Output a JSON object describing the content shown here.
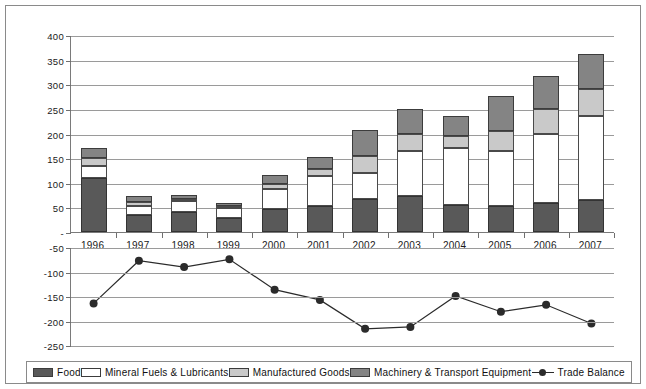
{
  "chart_data": {
    "type": "bar",
    "title": "",
    "xlabel": "",
    "ylabel": "",
    "grid": true,
    "legend_position": "bottom",
    "categories": [
      "1996",
      "1997",
      "1998",
      "1999",
      "2000",
      "2001",
      "2002",
      "2003",
      "2004",
      "2005",
      "2006",
      "2007"
    ],
    "upper_panel": {
      "ylim": [
        0,
        400
      ],
      "yticks": [
        0,
        50,
        100,
        150,
        200,
        250,
        300,
        350,
        400
      ],
      "ytick_labels": [
        "-",
        "50",
        "100",
        "150",
        "200",
        "250",
        "300",
        "350",
        "400"
      ],
      "stacked": true,
      "series": [
        {
          "name": "Food",
          "values": [
            110,
            35,
            40,
            28,
            47,
            52,
            68,
            73,
            55,
            52,
            58,
            65
          ]
        },
        {
          "name": "Mineral Fuels & Lubricants",
          "values": [
            24,
            18,
            22,
            20,
            41,
            61,
            52,
            92,
            115,
            113,
            142,
            170
          ]
        },
        {
          "name": "Manufactured Goods",
          "values": [
            16,
            8,
            5,
            5,
            10,
            15,
            35,
            35,
            25,
            40,
            50,
            55
          ]
        },
        {
          "name": "Machinery & Transport Equipment",
          "values": [
            21,
            12,
            8,
            5,
            17,
            24,
            52,
            50,
            40,
            72,
            67,
            72
          ]
        }
      ],
      "totals": [
        171,
        73,
        75,
        58,
        115,
        152,
        207,
        250,
        235,
        277,
        317,
        362
      ]
    },
    "lower_panel": {
      "ylim": [
        -250,
        -50
      ],
      "yticks": [
        -50,
        -100,
        -150,
        -200,
        -250
      ],
      "ytick_labels": [
        "-50",
        "-100",
        "-150",
        "-200",
        "-250"
      ],
      "series": [
        {
          "name": "Trade Balance",
          "values": [
            -163,
            -76,
            -89,
            -73,
            -135,
            -156,
            -215,
            -211,
            -148,
            -180,
            -166,
            -204
          ]
        }
      ]
    }
  },
  "legend": {
    "items": [
      {
        "label": "Food",
        "swatch": "food-swatch",
        "color": "#595959"
      },
      {
        "label": "Mineral Fuels & Lubricants",
        "swatch": "mineral-swatch",
        "color": "#ffffff"
      },
      {
        "label": "Manufactured Goods",
        "swatch": "manufactured-swatch",
        "color": "#c9c9c9"
      },
      {
        "label": "Machinery & Transport Equipment",
        "swatch": "machinery-swatch",
        "color": "#848484"
      },
      {
        "label": "Trade Balance",
        "swatch": "line-marker",
        "color": "#2b2b2b"
      }
    ]
  }
}
